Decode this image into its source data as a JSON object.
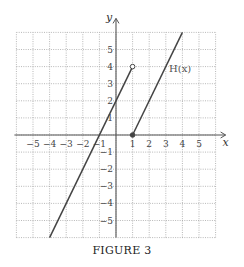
{
  "chart_data": {
    "type": "line",
    "title": "",
    "caption": "FIGURE 3",
    "xlabel": "x",
    "ylabel": "y",
    "xlim": [
      -6,
      6
    ],
    "ylim": [
      -6,
      6
    ],
    "grid": true,
    "grid_style": "dotted",
    "x_ticks": [
      -5,
      -4,
      -3,
      -2,
      -1,
      1,
      2,
      3,
      4,
      5
    ],
    "y_ticks": [
      -5,
      -4,
      -3,
      -2,
      -1,
      1,
      2,
      3,
      4,
      5
    ],
    "function_label": "H(x)",
    "series": [
      {
        "name": "H(x) left piece",
        "equation": "y = 2x + 2, x < 1",
        "points": [
          [
            -4,
            -6
          ],
          [
            1,
            4
          ]
        ],
        "endpoint": {
          "x": 1,
          "y": 4,
          "style": "open"
        }
      },
      {
        "name": "H(x) right piece",
        "equation": "y = 2x - 2, x >= 1",
        "points": [
          [
            1,
            0
          ],
          [
            4,
            6
          ]
        ],
        "endpoint": {
          "x": 1,
          "y": 0,
          "style": "closed"
        }
      }
    ],
    "label_position": {
      "x": 3.2,
      "y": 3.7
    }
  },
  "colors": {
    "grid": "#9a9a9a",
    "axis": "#555555",
    "curve": "#444444"
  }
}
